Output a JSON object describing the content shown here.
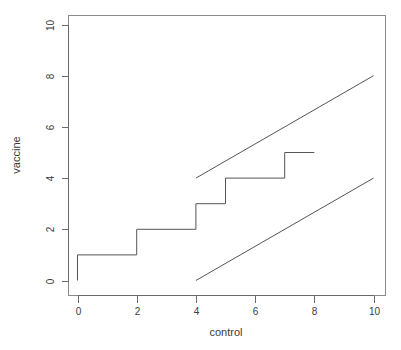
{
  "chart_data": {
    "type": "line",
    "title": "",
    "xlabel": "control",
    "ylabel": "vaccine",
    "xlim": [
      0,
      10
    ],
    "ylim": [
      0,
      10
    ],
    "xticks": [
      0,
      2,
      4,
      6,
      8,
      10
    ],
    "yticks": [
      0,
      2,
      4,
      6,
      8,
      10
    ],
    "xtick_labels": [
      "0",
      "2",
      "4",
      "6",
      "8",
      "10"
    ],
    "ytick_labels": [
      "0",
      "2",
      "4",
      "6",
      "8",
      "10"
    ],
    "grid": false,
    "legend": "none",
    "background": "#ffffff",
    "line_color": "#555555",
    "axis_color": "#6b6b6b",
    "text_color": "#3a3a3a",
    "series": [
      {
        "name": "step-function",
        "type": "step",
        "draw_style": "steps-post",
        "points": [
          {
            "x": 0,
            "y": 0
          },
          {
            "x": 0,
            "y": 1
          },
          {
            "x": 2,
            "y": 1
          },
          {
            "x": 2,
            "y": 2
          },
          {
            "x": 4,
            "y": 2
          },
          {
            "x": 4,
            "y": 3
          },
          {
            "x": 5,
            "y": 3
          },
          {
            "x": 5,
            "y": 4
          },
          {
            "x": 7,
            "y": 4
          },
          {
            "x": 7,
            "y": 5
          },
          {
            "x": 8,
            "y": 5
          }
        ]
      },
      {
        "name": "upper-reference-line",
        "type": "line",
        "points": [
          {
            "x": 4,
            "y": 4
          },
          {
            "x": 10,
            "y": 8
          }
        ],
        "slope": 0.6667,
        "intercept": 1.3333
      },
      {
        "name": "lower-reference-line",
        "type": "line",
        "points": [
          {
            "x": 4,
            "y": 0
          },
          {
            "x": 10,
            "y": 4
          }
        ],
        "slope": 0.6667,
        "intercept": -2.6667
      }
    ]
  },
  "axes": {
    "x_label": "control",
    "y_label": "vaccine"
  }
}
